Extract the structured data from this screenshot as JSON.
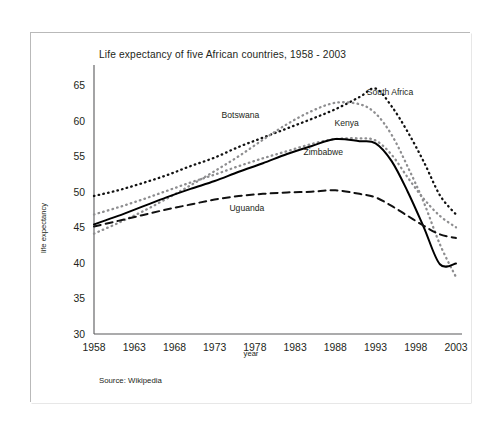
{
  "figure": {
    "title": "Life expectancy of five African countries, 1958 - 2003",
    "source_note": "Source: Wikipedia",
    "xlabel": "year",
    "ylabel": "life expectancy"
  },
  "chart_data": {
    "type": "line",
    "title": "Life expectancy of five African countries, 1958 - 2003",
    "xlabel": "year",
    "ylabel": "life expectancy",
    "xlim": [
      1958,
      2003
    ],
    "ylim": [
      30,
      65
    ],
    "xticks": [
      1958,
      1963,
      1968,
      1973,
      1978,
      1983,
      1988,
      1993,
      1998,
      2003
    ],
    "yticks": [
      30,
      35,
      40,
      45,
      50,
      55,
      60,
      65
    ],
    "grid": false,
    "legend_position": "inline-annotations",
    "x": [
      1958,
      1961,
      1964,
      1967,
      1970,
      1973,
      1976,
      1979,
      1982,
      1985,
      1988,
      1991,
      1993,
      1995,
      1997,
      1999,
      2001,
      2003
    ],
    "series": [
      {
        "name": "South Africa",
        "label": "South Africa",
        "style": "dotted",
        "color": "#111111",
        "values": [
          49.4,
          50.2,
          51.2,
          52.3,
          53.6,
          54.8,
          56.3,
          57.6,
          58.9,
          60.2,
          61.6,
          63.3,
          64.5,
          62.0,
          58.4,
          54.2,
          49.5,
          46.8
        ]
      },
      {
        "name": "Botswana",
        "label": "Botswana",
        "style": "dotted",
        "color": "#8e8e90",
        "values": [
          44.1,
          45.6,
          47.2,
          49.0,
          50.9,
          52.9,
          55.0,
          57.3,
          59.5,
          61.3,
          62.5,
          62.3,
          61.0,
          58.0,
          53.5,
          48.5,
          42.6,
          38.0
        ]
      },
      {
        "name": "Kenya",
        "label": "Kenya",
        "style": "dotted",
        "color": "#8e8e90",
        "values": [
          46.8,
          47.8,
          48.9,
          50.1,
          51.3,
          52.4,
          53.6,
          54.7,
          55.7,
          56.7,
          57.4,
          57.5,
          57.2,
          55.2,
          52.0,
          49.0,
          46.6,
          45.0
        ]
      },
      {
        "name": "Zimbabwe",
        "label": "Zimbabwe",
        "style": "solid",
        "color": "#000000",
        "values": [
          45.4,
          46.6,
          47.9,
          49.2,
          50.4,
          51.5,
          52.8,
          54.0,
          55.3,
          56.4,
          57.4,
          57.1,
          56.8,
          54.3,
          50.0,
          45.0,
          39.8,
          39.9
        ]
      },
      {
        "name": "Uguanda",
        "label": "Uguanda",
        "style": "dashed",
        "color": "#111111",
        "values": [
          45.1,
          45.9,
          46.7,
          47.5,
          48.2,
          48.9,
          49.4,
          49.7,
          49.9,
          50.0,
          50.2,
          49.7,
          49.2,
          48.0,
          46.6,
          45.2,
          44.0,
          43.5
        ]
      }
    ],
    "annotations": [
      {
        "text": "South Africa",
        "x": 1994.8,
        "y": 63.6
      },
      {
        "text": "Botswana",
        "x": 1976.2,
        "y": 60.4
      },
      {
        "text": "Kenya",
        "x": 1989.4,
        "y": 59.2
      },
      {
        "text": "Zimbabwe",
        "x": 1986.5,
        "y": 55.2
      },
      {
        "text": "Uguanda",
        "x": 1977.0,
        "y": 47.3
      }
    ]
  }
}
